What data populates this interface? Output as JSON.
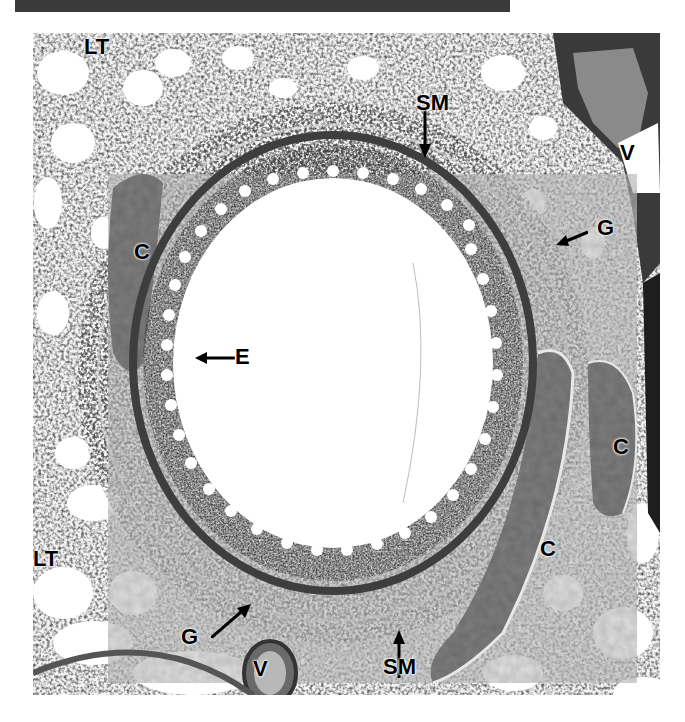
{
  "figure": {
    "labels": [
      {
        "id": "lt-top",
        "text": "LT",
        "meaning": "lung tissue",
        "x": 84,
        "y": 36
      },
      {
        "id": "sm-top",
        "text": "SM",
        "meaning": "smooth muscle",
        "x": 416,
        "y": 92
      },
      {
        "id": "v-right",
        "text": "V",
        "meaning": "vessel",
        "x": 620,
        "y": 142
      },
      {
        "id": "g-right",
        "text": "G",
        "meaning": "gland",
        "x": 597,
        "y": 217
      },
      {
        "id": "c-left",
        "text": "C",
        "meaning": "cartilage",
        "x": 134,
        "y": 241
      },
      {
        "id": "e-left",
        "text": "E",
        "meaning": "epithelium",
        "x": 235,
        "y": 346
      },
      {
        "id": "c-right-upper",
        "text": "C",
        "meaning": "cartilage",
        "x": 613,
        "y": 436
      },
      {
        "id": "c-right-lower",
        "text": "C",
        "meaning": "cartilage",
        "x": 540,
        "y": 538
      },
      {
        "id": "lt-left",
        "text": "LT",
        "meaning": "lung tissue",
        "x": 33,
        "y": 548
      },
      {
        "id": "g-bottom",
        "text": "G",
        "meaning": "gland",
        "x": 181,
        "y": 626
      },
      {
        "id": "v-bottom",
        "text": "V",
        "meaning": "vessel",
        "x": 253,
        "y": 658
      },
      {
        "id": "sm-bottom",
        "text": "SM",
        "meaning": "smooth muscle",
        "x": 383,
        "y": 656
      }
    ],
    "colors": {
      "lumen": "#ffffff",
      "tissue_dark": "#2e2e2e",
      "tissue_mid": "#6b6b6b",
      "cartilage": "#8c8c8c",
      "banner": "#3a3a3a"
    }
  }
}
